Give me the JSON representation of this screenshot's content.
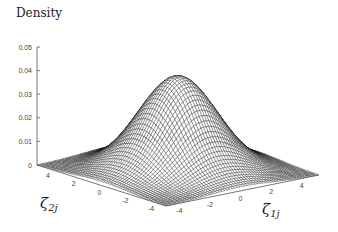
{
  "chart_data": {
    "type": "surface3d",
    "title": "Density",
    "xlabel": "ζ1j",
    "ylabel": "ζ2j",
    "zlabel": "Density",
    "x_ticks": [
      -4,
      -2,
      0,
      2,
      4
    ],
    "y_ticks": [
      -4,
      -2,
      0,
      2,
      4
    ],
    "z_ticks": [
      "0",
      "0.01",
      "0.02",
      "0.03",
      "0.04",
      "0.05"
    ],
    "xlim": [
      -5,
      5
    ],
    "ylim": [
      -5,
      5
    ],
    "zlim": [
      0,
      0.05
    ],
    "grid": false,
    "legend": null,
    "surface": {
      "function": "bivariate normal density",
      "mean": [
        0,
        0
      ],
      "sd": [
        2,
        2
      ],
      "correlation": 0,
      "peak_density": 0.0398,
      "mesh_resolution": 60,
      "style": "wireframe (hidden-line)",
      "line_color": "#000000"
    }
  },
  "labels": {
    "title": "Density",
    "x_axis_main": "ζ",
    "x_axis_sub": "1j",
    "y_axis_main": "ζ",
    "y_axis_sub": "2j"
  }
}
